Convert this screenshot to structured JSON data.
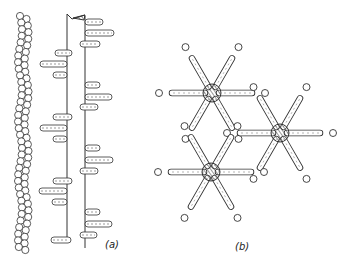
{
  "figure": {
    "panels": [
      {
        "id": "a",
        "label": "(a)",
        "description": "Bead chain beside a backbone with pill-shaped side chains"
      },
      {
        "id": "b",
        "label": "(b)",
        "description": "Three six-armed units with hatched cores and surrounding small circles"
      }
    ]
  },
  "colors": {
    "ink": "#333333",
    "background": "#ffffff"
  },
  "panel_b": {
    "stars": [
      {
        "cx": 212,
        "cy": 93
      },
      {
        "cx": 280,
        "cy": 133
      },
      {
        "cx": 211,
        "cy": 172
      }
    ],
    "arm_length": 40,
    "core_radius": 9
  }
}
